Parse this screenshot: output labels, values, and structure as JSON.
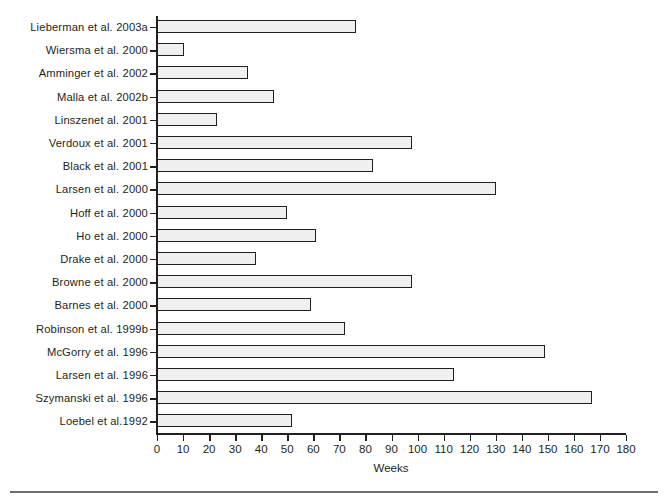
{
  "chart_data": {
    "type": "bar",
    "orientation": "horizontal",
    "title": "",
    "xlabel": "Weeks",
    "ylabel": "",
    "xlim": [
      0,
      180
    ],
    "xticks": [
      0,
      10,
      20,
      30,
      40,
      50,
      60,
      70,
      80,
      90,
      100,
      110,
      120,
      130,
      140,
      150,
      160,
      170,
      180
    ],
    "grid": false,
    "legend": null,
    "bar_fill_color": "#f0f0ee",
    "bar_edge_color": "#231f20",
    "categories": [
      "Lieberman et al. 2003a",
      "Wiersma et al. 2000",
      "Amminger et al. 2002",
      "Malla et al. 2002b",
      "Linszenet al. 2001",
      "Verdoux et al. 2001",
      "Black et al. 2001",
      "Larsen et al. 2000",
      "Hoff et al. 2000",
      "Ho et al. 2000",
      "Drake et al. 2000",
      "Browne et al. 2000",
      "Barnes et al. 2000",
      "Robinson et al. 1999b",
      "McGorry et al. 1996",
      "Larsen et al. 1996",
      "Szymanski et al. 1996",
      "Loebel et al.1992"
    ],
    "values": [
      76.5,
      10.5,
      35,
      45,
      23,
      98,
      83,
      130,
      50,
      61,
      38,
      98,
      59,
      72,
      149,
      114,
      167,
      52
    ]
  },
  "axis": {
    "x_title": "Weeks",
    "tick_labels": [
      "0",
      "10",
      "20",
      "30",
      "40",
      "50",
      "60",
      "70",
      "80",
      "90",
      "100",
      "110",
      "120",
      "130",
      "140",
      "150",
      "160",
      "170",
      "180"
    ]
  }
}
